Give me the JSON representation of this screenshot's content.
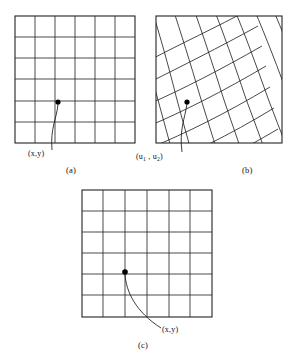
{
  "figure": {
    "kind": "line-drawing",
    "background_color": "#ffffff",
    "ink_color": "#1a1a1a",
    "panels": [
      {
        "id": "a",
        "caption": "(a)",
        "caption_pos": {
          "x": 68,
          "y": 169
        },
        "grid": {
          "type": "regular",
          "cols": 6,
          "rows": 6,
          "x": 15,
          "y": 16,
          "width": 120,
          "height": 127
        },
        "marker": {
          "label": "(x,y)",
          "x": 58,
          "y": 102,
          "r": 2.6
        },
        "label_pos": {
          "x": 28,
          "y": 152
        },
        "leader": {
          "from": [
            58,
            103
          ],
          "to": [
            52,
            150
          ]
        }
      },
      {
        "id": "b",
        "caption": "(b)",
        "caption_pos": {
          "x": 245,
          "y": 169
        },
        "grid": {
          "type": "warped",
          "cols": 6,
          "rows": 6,
          "x": 156,
          "y": 16,
          "width": 126,
          "height": 127,
          "rotation_deg": -16,
          "curvature": 0.1
        },
        "marker": {
          "label": "(u1 , u2)",
          "x": 187,
          "y": 102,
          "r": 2.6
        },
        "label_pos": {
          "x": 137,
          "y": 156
        },
        "leader": {
          "from": [
            187,
            103
          ],
          "to": [
            182,
            152
          ]
        }
      },
      {
        "id": "c",
        "caption": "(c)",
        "caption_pos": {
          "x": 140,
          "y": 344
        },
        "grid": {
          "type": "regular",
          "cols": 6,
          "rows": 6,
          "x": 82,
          "y": 190,
          "width": 130,
          "height": 127
        },
        "marker": {
          "label": "(x,y)",
          "x": 125,
          "y": 272,
          "r": 2.8
        },
        "label_pos": {
          "x": 163,
          "y": 332
        },
        "leader": {
          "from": [
            125,
            273
          ],
          "to": [
            161,
            328
          ]
        }
      }
    ],
    "labels": {
      "xy": "(x,y)",
      "u1u2_open": "(u",
      "u1u2_sub1": "1",
      "u1u2_mid": " , u",
      "u1u2_sub2": "2",
      "u1u2_close": ")"
    }
  }
}
